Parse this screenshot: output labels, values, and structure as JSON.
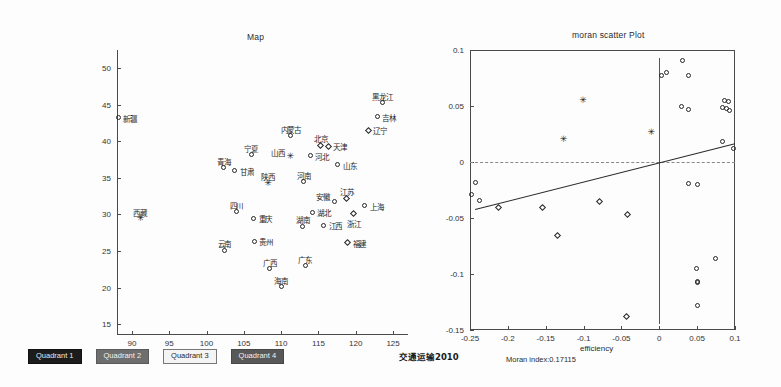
{
  "footer": {
    "year_label": "交通运输2010",
    "moran_index_label": "Moran index:0.17115",
    "legend": [
      {
        "label": "Quadrant 1",
        "style": "q1"
      },
      {
        "label": "Quadrant 2",
        "style": "q2"
      },
      {
        "label": "Quadrant 3",
        "style": "q3"
      },
      {
        "label": "Quadrant 4",
        "style": "q4"
      }
    ]
  },
  "chart_data": [
    {
      "type": "scatter",
      "title": "Map",
      "xlabel": "",
      "ylabel": "",
      "xlim": [
        88,
        127
      ],
      "ylim": [
        13.5,
        52.5
      ],
      "xticks": [
        90,
        95,
        100,
        105,
        110,
        115,
        120,
        125
      ],
      "yticks": [
        15,
        20,
        25,
        30,
        35,
        40,
        45,
        50
      ],
      "grid": false,
      "legend_position": "bottom-left-outside",
      "points": [
        {
          "label": "新疆",
          "x": 88.2,
          "y": 43.2,
          "marker": "circle",
          "label_pos": "right"
        },
        {
          "label": "黑龙江",
          "x": 123.6,
          "y": 45.3,
          "marker": "circle",
          "label_pos": "above"
        },
        {
          "label": "吉林",
          "x": 122.9,
          "y": 43.4,
          "marker": "circle",
          "label_pos": "right"
        },
        {
          "label": "辽宁",
          "x": 121.7,
          "y": 41.5,
          "marker": "diamond",
          "label_pos": "right"
        },
        {
          "label": "内蒙古",
          "x": 111.3,
          "y": 40.8,
          "marker": "circle",
          "label_pos": "above"
        },
        {
          "label": "北京",
          "x": 115.3,
          "y": 39.5,
          "marker": "diamond",
          "label_pos": "above"
        },
        {
          "label": "天津",
          "x": 116.3,
          "y": 39.3,
          "marker": "diamond",
          "label_pos": "right"
        },
        {
          "label": "宁夏",
          "x": 106.0,
          "y": 38.2,
          "marker": "circle",
          "label_pos": "above"
        },
        {
          "label": "山西",
          "x": 111.2,
          "y": 37.9,
          "marker": "star",
          "label_pos": "left"
        },
        {
          "label": "河北",
          "x": 113.9,
          "y": 38.0,
          "marker": "circle",
          "label_pos": "right"
        },
        {
          "label": "青海",
          "x": 102.3,
          "y": 36.4,
          "marker": "circle",
          "label_pos": "above"
        },
        {
          "label": "甘肃",
          "x": 103.8,
          "y": 36.0,
          "marker": "circle",
          "label_pos": "right"
        },
        {
          "label": "山东",
          "x": 117.6,
          "y": 36.8,
          "marker": "circle",
          "label_pos": "right"
        },
        {
          "label": "陕西",
          "x": 108.2,
          "y": 34.3,
          "marker": "star",
          "label_pos": "above"
        },
        {
          "label": "河南",
          "x": 113.0,
          "y": 34.5,
          "marker": "circle",
          "label_pos": "above"
        },
        {
          "label": "江苏",
          "x": 118.8,
          "y": 32.2,
          "marker": "diamond",
          "label_pos": "above"
        },
        {
          "label": "安徽",
          "x": 117.2,
          "y": 31.8,
          "marker": "circle",
          "label_pos": "left"
        },
        {
          "label": "上海",
          "x": 121.2,
          "y": 31.2,
          "marker": "circle",
          "label_pos": "right"
        },
        {
          "label": "四川",
          "x": 104.0,
          "y": 30.4,
          "marker": "circle",
          "label_pos": "above"
        },
        {
          "label": "湖北",
          "x": 114.2,
          "y": 30.3,
          "marker": "circle",
          "label_pos": "right"
        },
        {
          "label": "重庆",
          "x": 106.3,
          "y": 29.5,
          "marker": "circle",
          "label_pos": "right"
        },
        {
          "label": "浙江",
          "x": 119.7,
          "y": 30.1,
          "marker": "diamond",
          "label_pos": "below"
        },
        {
          "label": "湖南",
          "x": 112.9,
          "y": 28.4,
          "marker": "circle",
          "label_pos": "above"
        },
        {
          "label": "江西",
          "x": 115.7,
          "y": 28.5,
          "marker": "circle",
          "label_pos": "right"
        },
        {
          "label": "西藏",
          "x": 91.1,
          "y": 29.4,
          "marker": "star",
          "label_pos": "above"
        },
        {
          "label": "贵州",
          "x": 106.4,
          "y": 26.3,
          "marker": "circle",
          "label_pos": "right"
        },
        {
          "label": "福建",
          "x": 118.9,
          "y": 26.1,
          "marker": "diamond",
          "label_pos": "right"
        },
        {
          "label": "云南",
          "x": 102.4,
          "y": 25.1,
          "marker": "circle",
          "label_pos": "above"
        },
        {
          "label": "广东",
          "x": 113.2,
          "y": 23.0,
          "marker": "circle",
          "label_pos": "above"
        },
        {
          "label": "广西",
          "x": 108.5,
          "y": 22.6,
          "marker": "circle",
          "label_pos": "above"
        },
        {
          "label": "海南",
          "x": 110.0,
          "y": 20.1,
          "marker": "circle",
          "label_pos": "above"
        }
      ]
    },
    {
      "type": "scatter",
      "title": "moran scatter Plot",
      "xlabel": "efficiency",
      "ylabel": "",
      "xlim": [
        -0.25,
        0.1
      ],
      "ylim": [
        -0.15,
        0.1
      ],
      "xticks": [
        -0.25,
        -0.2,
        -0.15,
        -0.1,
        -0.05,
        0,
        0.05,
        0.1
      ],
      "yticks": [
        -0.15,
        -0.1,
        -0.05,
        0,
        0.05,
        0.1
      ],
      "grid": false,
      "zero_lines": true,
      "regression": {
        "slope": 0.17115,
        "intercept": 0.0,
        "label": "Moran index:0.17115"
      },
      "points": [
        {
          "x": 0.003,
          "y": 0.077,
          "marker": "circle"
        },
        {
          "x": 0.01,
          "y": 0.08,
          "marker": "circle"
        },
        {
          "x": 0.03,
          "y": 0.091,
          "marker": "circle"
        },
        {
          "x": 0.039,
          "y": 0.077,
          "marker": "circle"
        },
        {
          "x": 0.029,
          "y": 0.05,
          "marker": "circle"
        },
        {
          "x": 0.038,
          "y": 0.047,
          "marker": "circle"
        },
        {
          "x": 0.086,
          "y": 0.055,
          "marker": "circle"
        },
        {
          "x": 0.091,
          "y": 0.054,
          "marker": "circle"
        },
        {
          "x": 0.084,
          "y": 0.049,
          "marker": "circle"
        },
        {
          "x": 0.089,
          "y": 0.048,
          "marker": "circle"
        },
        {
          "x": 0.093,
          "y": 0.046,
          "marker": "circle"
        },
        {
          "x": 0.084,
          "y": 0.018,
          "marker": "circle"
        },
        {
          "x": 0.098,
          "y": 0.012,
          "marker": "circle"
        },
        {
          "x": -0.101,
          "y": 0.055,
          "marker": "star"
        },
        {
          "x": -0.127,
          "y": 0.02,
          "marker": "star"
        },
        {
          "x": -0.011,
          "y": 0.026,
          "marker": "star"
        },
        {
          "x": -0.243,
          "y": -0.018,
          "marker": "circle"
        },
        {
          "x": -0.248,
          "y": -0.029,
          "marker": "circle"
        },
        {
          "x": -0.238,
          "y": -0.034,
          "marker": "circle"
        },
        {
          "x": 0.038,
          "y": -0.019,
          "marker": "circle"
        },
        {
          "x": -0.212,
          "y": -0.041,
          "marker": "diamond"
        },
        {
          "x": -0.154,
          "y": -0.041,
          "marker": "diamond"
        },
        {
          "x": -0.079,
          "y": -0.035,
          "marker": "diamond"
        },
        {
          "x": -0.042,
          "y": -0.047,
          "marker": "diamond"
        },
        {
          "x": -0.134,
          "y": -0.066,
          "marker": "diamond"
        },
        {
          "x": -0.043,
          "y": -0.138,
          "marker": "diamond"
        },
        {
          "x": 0.05,
          "y": -0.02,
          "marker": "circle"
        },
        {
          "x": 0.074,
          "y": -0.086,
          "marker": "circle"
        },
        {
          "x": 0.049,
          "y": -0.095,
          "marker": "circle"
        },
        {
          "x": 0.05,
          "y": -0.107,
          "marker": "circle"
        },
        {
          "x": 0.051,
          "y": -0.108,
          "marker": "circle"
        },
        {
          "x": 0.05,
          "y": -0.128,
          "marker": "circle"
        }
      ]
    }
  ]
}
